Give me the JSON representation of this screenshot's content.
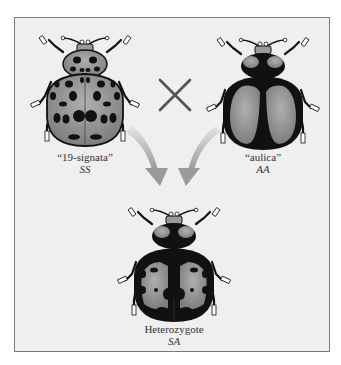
{
  "figure": {
    "type": "genetic cross diagram",
    "cross_symbol": "×",
    "parents": [
      {
        "name": "“19-signata”",
        "genotype": "SS",
        "pattern": "spotted"
      },
      {
        "name": "“aulica”",
        "genotype": "AA",
        "pattern": "dark with two large pale patches"
      }
    ],
    "offspring": {
      "name": "Heterozygote",
      "genotype": "SA",
      "pattern": "dark with pale patches and spots"
    }
  },
  "colors": {
    "panel_bg": "#efefef",
    "panel_border": "#7a7a7a",
    "beetle_dark": "#111111",
    "beetle_pale": "#9a9a9a",
    "arrow": "#a8a8a8",
    "cross": "#555555"
  }
}
